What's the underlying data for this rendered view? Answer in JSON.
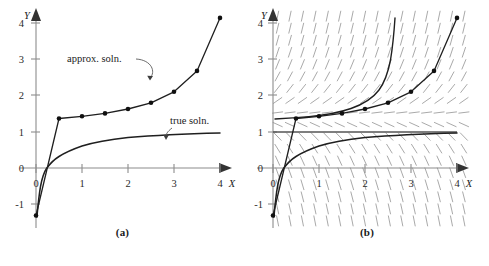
{
  "figure": {
    "panels": [
      {
        "id": "a",
        "caption": "(a)",
        "axes": {
          "x_name": "X",
          "y_name": "Y",
          "x_ticks": [
            "0",
            "1",
            "2",
            "3",
            "4"
          ],
          "y_ticks": [
            "4",
            "3",
            "2",
            "1",
            "0",
            "-1"
          ],
          "xlim": [
            -0.25,
            4.3
          ],
          "ylim": [
            -1.6,
            4.4
          ]
        },
        "annotations": [
          {
            "name": "approx-soln-label",
            "text": "approx. soln."
          },
          {
            "name": "true-soln-label",
            "text": "true soln."
          }
        ]
      },
      {
        "id": "b",
        "caption": "(b)",
        "axes": {
          "x_name": "X",
          "y_name": "Y",
          "x_ticks": [
            "0",
            "1",
            "2",
            "3",
            "4"
          ],
          "y_ticks": [
            "4",
            "3",
            "2",
            "1",
            "0",
            "-1"
          ],
          "xlim": [
            -0.25,
            4.3
          ],
          "ylim": [
            -1.6,
            4.4
          ]
        },
        "direction_field": {
          "label": "slope field",
          "x_start": 0.1,
          "x_step": 0.27,
          "x_count": 16,
          "y_start": -1.45,
          "y_step": 0.33,
          "y_count": 18,
          "segment_length": 11
        }
      }
    ]
  },
  "chart_data": [
    {
      "type": "line",
      "panel": "a",
      "title": "",
      "xlabel": "X",
      "ylabel": "Y",
      "xlim": [
        -0.25,
        4.3
      ],
      "ylim": [
        -1.6,
        4.4
      ],
      "xticks": [
        0,
        1,
        2,
        3,
        4
      ],
      "yticks": [
        -1,
        0,
        1,
        2,
        3,
        4
      ],
      "grid": false,
      "legend": "inline-annotations",
      "series": [
        {
          "name": "approx. soln.",
          "style": "polyline-with-markers",
          "markers": true,
          "x": [
            0.0,
            0.5,
            1.0,
            1.5,
            2.0,
            2.5,
            3.0,
            3.5,
            4.0
          ],
          "y": [
            -1.3,
            1.35,
            1.41,
            1.49,
            1.61,
            1.78,
            2.08,
            2.65,
            4.1
          ]
        },
        {
          "name": "true soln.",
          "style": "smooth-curve",
          "markers": false,
          "x": [
            0.02,
            0.05,
            0.1,
            0.15,
            0.2,
            0.3,
            0.4,
            0.5,
            0.7,
            1.0,
            1.3,
            1.6,
            2.0,
            2.5,
            3.0,
            3.5,
            4.0
          ],
          "y": [
            -1.35,
            -1.0,
            -0.62,
            -0.38,
            -0.22,
            0.02,
            0.16,
            0.27,
            0.4,
            0.5,
            0.56,
            0.6,
            0.64,
            0.67,
            0.69,
            0.71,
            0.72
          ]
        }
      ]
    },
    {
      "type": "line",
      "panel": "b",
      "title": "",
      "xlabel": "X",
      "ylabel": "Y",
      "xlim": [
        -0.25,
        4.3
      ],
      "ylim": [
        -1.6,
        4.4
      ],
      "xticks": [
        0,
        1,
        2,
        3,
        4
      ],
      "yticks": [
        -1,
        0,
        1,
        2,
        3,
        4
      ],
      "grid": false,
      "background": "direction-field",
      "series": [
        {
          "name": "approx. soln.",
          "style": "polyline-with-markers",
          "markers": true,
          "x": [
            0.0,
            0.5,
            1.0,
            1.5,
            2.0,
            2.5,
            3.0,
            3.5,
            4.0
          ],
          "y": [
            -1.3,
            1.35,
            1.41,
            1.49,
            1.61,
            1.78,
            2.08,
            2.65,
            4.1
          ]
        },
        {
          "name": "true soln.",
          "style": "smooth-curve",
          "markers": false,
          "x": [
            0.02,
            0.05,
            0.1,
            0.15,
            0.2,
            0.3,
            0.4,
            0.5,
            0.7,
            1.0,
            1.3,
            1.6,
            2.0,
            2.5,
            3.0,
            3.5,
            4.0
          ],
          "y": [
            -1.35,
            -1.0,
            -0.62,
            -0.38,
            -0.22,
            0.02,
            0.16,
            0.27,
            0.4,
            0.5,
            0.56,
            0.6,
            0.64,
            0.67,
            0.69,
            0.71,
            0.72
          ]
        },
        {
          "name": "blow-up solution",
          "style": "smooth-curve",
          "markers": false,
          "x": [
            0.05,
            0.4,
            0.9,
            1.4,
            1.8,
            2.1,
            2.35,
            2.55,
            2.7,
            2.8,
            2.87,
            2.92
          ],
          "y": [
            1.33,
            1.38,
            1.45,
            1.58,
            1.75,
            1.95,
            2.2,
            2.55,
            2.95,
            3.45,
            3.95,
            4.35
          ]
        },
        {
          "name": "equilibrium y = 1",
          "style": "horizontal-line",
          "markers": false,
          "x": [
            0.0,
            4.2
          ],
          "y": [
            1.0,
            1.0
          ]
        }
      ]
    }
  ]
}
